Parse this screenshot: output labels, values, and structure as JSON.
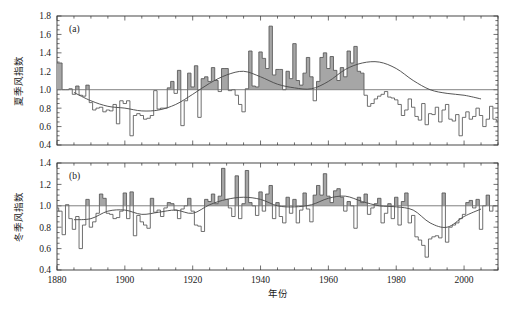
{
  "figure": {
    "background": "#ffffff",
    "line_color": "#555555",
    "fill_color": "#a6a6a6",
    "smooth_color": "#4d4d4d",
    "axis_color": "#333333",
    "xlabel": "年份",
    "panels": [
      {
        "id": "a",
        "label": "(a)",
        "ylabel": "夏季风指数"
      },
      {
        "id": "b",
        "label": "(b)",
        "ylabel": "冬季风指数"
      }
    ]
  },
  "chart_data": [
    {
      "type": "line",
      "panel": "(a)",
      "title": "",
      "xlabel": "年份",
      "ylabel": "夏季风指数",
      "xlim": [
        1880,
        2010
      ],
      "ylim": [
        0.4,
        1.8
      ],
      "xticks": [
        1880,
        1900,
        1920,
        1940,
        1960,
        1980,
        2000
      ],
      "xtick_labels": [
        "1880",
        "1900",
        "1920",
        "1940",
        "1960",
        "1980",
        "2000"
      ],
      "xminor_step": 5,
      "yticks": [
        0.4,
        0.6,
        0.8,
        1.0,
        1.2,
        1.4,
        1.6,
        1.8
      ],
      "ytick_labels": [
        "0.4",
        "0.6",
        "0.8",
        "1.0",
        "1.2",
        "1.4",
        "1.6",
        "1.8"
      ],
      "yminor_step": 0.05,
      "grid": false,
      "reference_line": 1.0,
      "fill_above_reference": true,
      "series": [
        {
          "name": "夏季风指数",
          "style": "step",
          "x": [
            1880,
            1881,
            1882,
            1883,
            1884,
            1885,
            1886,
            1887,
            1888,
            1889,
            1890,
            1891,
            1892,
            1893,
            1894,
            1895,
            1896,
            1897,
            1898,
            1899,
            1900,
            1901,
            1902,
            1903,
            1904,
            1905,
            1906,
            1907,
            1908,
            1909,
            1910,
            1911,
            1912,
            1913,
            1914,
            1915,
            1916,
            1917,
            1918,
            1919,
            1920,
            1921,
            1922,
            1923,
            1924,
            1925,
            1926,
            1927,
            1928,
            1929,
            1930,
            1931,
            1932,
            1933,
            1934,
            1935,
            1936,
            1937,
            1938,
            1939,
            1940,
            1941,
            1942,
            1943,
            1944,
            1945,
            1946,
            1947,
            1948,
            1949,
            1950,
            1951,
            1952,
            1953,
            1954,
            1955,
            1956,
            1957,
            1958,
            1959,
            1960,
            1961,
            1962,
            1963,
            1964,
            1965,
            1966,
            1967,
            1968,
            1969,
            1970,
            1971,
            1972,
            1973,
            1974,
            1975,
            1976,
            1977,
            1978,
            1979,
            1980,
            1981,
            1982,
            1983,
            1984,
            1985,
            1986,
            1987,
            1988,
            1989,
            1990,
            1991,
            1992,
            1993,
            1994,
            1995,
            1996,
            1997,
            1998,
            1999,
            2000,
            2001,
            2002,
            2003,
            2004,
            2005,
            2006,
            2007,
            2008,
            2009,
            2010
          ],
          "values": [
            1.29,
            1.29,
            1.0,
            1.0,
            1.01,
            0.95,
            1.04,
            0.94,
            0.93,
            1.05,
            0.86,
            0.78,
            0.8,
            0.81,
            0.76,
            0.78,
            0.77,
            0.84,
            0.63,
            0.88,
            0.85,
            0.88,
            0.5,
            0.72,
            0.74,
            0.72,
            0.68,
            0.69,
            0.72,
            0.99,
            0.79,
            0.8,
            0.8,
            1.02,
            1.09,
            0.96,
            1.21,
            0.61,
            0.88,
            1.18,
            1.03,
            1.26,
            0.7,
            1.12,
            1.14,
            1.09,
            1.24,
            1.1,
            0.98,
            1.23,
            1.23,
            0.99,
            1.0,
            0.94,
            0.84,
            0.76,
            1.01,
            1.42,
            1.04,
            1.03,
            1.41,
            1.34,
            1.23,
            1.69,
            1.16,
            1.22,
            1.22,
            1.0,
            1.2,
            1.12,
            1.5,
            1.1,
            1.05,
            1.18,
            1.35,
            1.14,
            0.88,
            1.09,
            1.35,
            1.4,
            1.23,
            1.36,
            1.21,
            1.1,
            1.24,
            1.14,
            1.42,
            1.29,
            1.47,
            1.2,
            1.18,
            0.94,
            0.82,
            0.85,
            0.9,
            0.93,
            0.95,
            0.98,
            0.92,
            0.91,
            0.89,
            0.84,
            0.72,
            0.78,
            0.9,
            0.81,
            0.71,
            0.67,
            0.85,
            0.62,
            0.74,
            0.73,
            0.81,
            0.65,
            0.78,
            0.84,
            0.68,
            0.66,
            0.73,
            0.5,
            0.7,
            0.76,
            0.68,
            0.71,
            0.8,
            0.72,
            0.6,
            0.68,
            0.82,
            0.68,
            0.66
          ]
        },
        {
          "name": "11年低通滤波",
          "style": "smooth",
          "x": [
            1885,
            1890,
            1895,
            1900,
            1905,
            1910,
            1915,
            1920,
            1925,
            1930,
            1935,
            1940,
            1945,
            1950,
            1955,
            1960,
            1965,
            1970,
            1975,
            1980,
            1985,
            1990,
            1995,
            2000,
            2005
          ],
          "values": [
            0.97,
            0.88,
            0.82,
            0.8,
            0.77,
            0.78,
            0.84,
            0.95,
            1.07,
            1.16,
            1.2,
            1.14,
            1.06,
            1.02,
            1.01,
            1.09,
            1.22,
            1.29,
            1.3,
            1.23,
            1.1,
            1.0,
            0.96,
            0.94,
            0.9
          ]
        }
      ]
    },
    {
      "type": "line",
      "panel": "(b)",
      "title": "",
      "xlabel": "年份",
      "ylabel": "冬季风指数",
      "xlim": [
        1880,
        2010
      ],
      "ylim": [
        0.4,
        1.4
      ],
      "xticks": [
        1880,
        1900,
        1920,
        1940,
        1960,
        1980,
        2000
      ],
      "xtick_labels": [
        "1880",
        "1900",
        "1920",
        "1940",
        "1960",
        "1980",
        "2000"
      ],
      "xminor_step": 5,
      "yticks": [
        0.4,
        0.6,
        0.8,
        1.0,
        1.2,
        1.4
      ],
      "ytick_labels": [
        "0.4",
        "0.6",
        "0.8",
        "1.0",
        "1.2",
        "1.4"
      ],
      "yminor_step": 0.05,
      "grid": false,
      "reference_line": 1.0,
      "fill_above_reference": true,
      "series": [
        {
          "name": "冬季风指数",
          "style": "step",
          "x": [
            1880,
            1881,
            1882,
            1883,
            1884,
            1885,
            1886,
            1887,
            1888,
            1889,
            1890,
            1891,
            1892,
            1893,
            1894,
            1895,
            1896,
            1897,
            1898,
            1899,
            1900,
            1901,
            1902,
            1903,
            1904,
            1905,
            1906,
            1907,
            1908,
            1909,
            1910,
            1911,
            1912,
            1913,
            1914,
            1915,
            1916,
            1917,
            1918,
            1919,
            1920,
            1921,
            1922,
            1923,
            1924,
            1925,
            1926,
            1927,
            1928,
            1929,
            1930,
            1931,
            1932,
            1933,
            1934,
            1935,
            1936,
            1937,
            1938,
            1939,
            1940,
            1941,
            1942,
            1943,
            1944,
            1945,
            1946,
            1947,
            1948,
            1949,
            1950,
            1951,
            1952,
            1953,
            1954,
            1955,
            1956,
            1957,
            1958,
            1959,
            1960,
            1961,
            1962,
            1963,
            1964,
            1965,
            1966,
            1967,
            1968,
            1969,
            1970,
            1971,
            1972,
            1973,
            1974,
            1975,
            1976,
            1977,
            1978,
            1979,
            1980,
            1981,
            1982,
            1983,
            1984,
            1985,
            1986,
            1987,
            1988,
            1989,
            1990,
            1991,
            1992,
            1993,
            1994,
            1995,
            1996,
            1997,
            1998,
            1999,
            2000,
            2001,
            2002,
            2003,
            2004,
            2005,
            2006,
            2007,
            2008,
            2009,
            2010
          ],
          "values": [
            0.98,
            0.95,
            0.73,
            1.01,
            0.88,
            0.78,
            0.9,
            0.6,
            0.82,
            1.06,
            0.8,
            0.85,
            0.93,
            1.11,
            1.07,
            0.93,
            0.92,
            0.88,
            0.89,
            0.95,
            1.12,
            0.88,
            1.13,
            0.72,
            0.91,
            0.85,
            0.82,
            0.79,
            1.07,
            0.94,
            0.96,
            0.9,
            0.98,
            1.03,
            1.02,
            0.96,
            0.88,
            0.97,
            1.0,
            1.07,
            0.95,
            0.82,
            0.81,
            0.76,
            1.06,
            1.04,
            1.11,
            1.02,
            1.09,
            1.35,
            1.06,
            0.98,
            0.9,
            1.28,
            0.88,
            1.02,
            1.33,
            1.03,
            1.0,
            0.91,
            1.13,
            0.95,
            1.11,
            1.19,
            0.88,
            1.03,
            0.9,
            0.84,
            1.08,
            0.93,
            1.06,
            0.84,
            0.96,
            1.12,
            0.97,
            0.85,
            1.1,
            1.19,
            1.1,
            1.3,
            1.09,
            1.03,
            1.14,
            1.16,
            1.08,
            0.95,
            1.04,
            1.0,
            0.79,
            1.08,
            1.03,
            1.11,
            0.92,
            0.98,
            1.02,
            1.07,
            0.84,
            0.93,
            1.02,
            0.88,
            1.08,
            0.82,
            1.04,
            1.12,
            0.84,
            0.91,
            0.71,
            0.68,
            0.63,
            0.52,
            0.69,
            0.71,
            0.72,
            0.7,
            1.12,
            0.66,
            0.8,
            0.82,
            0.84,
            0.88,
            0.92,
            1.03,
            1.05,
            0.98,
            1.06,
            0.78,
            1.0,
            1.1,
            0.95,
            1.0
          ]
        },
        {
          "name": "11年低通滤波",
          "style": "smooth",
          "x": [
            1885,
            1890,
            1895,
            1900,
            1905,
            1910,
            1915,
            1920,
            1925,
            1930,
            1935,
            1940,
            1945,
            1950,
            1955,
            1960,
            1965,
            1970,
            1975,
            1980,
            1985,
            1990,
            1995,
            2000,
            2005
          ],
          "values": [
            0.87,
            0.88,
            0.95,
            0.96,
            0.92,
            0.94,
            0.96,
            0.93,
            1.01,
            1.06,
            1.08,
            1.06,
            1.0,
            0.99,
            1.01,
            1.07,
            1.09,
            1.04,
            1.0,
            0.99,
            0.96,
            0.84,
            0.8,
            0.9,
            0.97
          ]
        }
      ]
    }
  ]
}
